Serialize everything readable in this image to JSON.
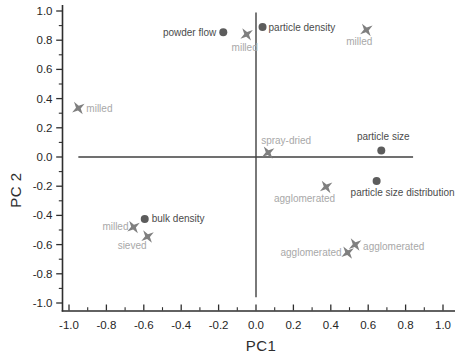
{
  "chart_data": {
    "type": "scatter",
    "title": "",
    "xlabel": "PC1",
    "ylabel": "PC 2",
    "xlim": [
      -1.1,
      1.1
    ],
    "ylim": [
      -1.1,
      1.1
    ],
    "x_ticks": [
      "-1.0",
      "-0.8",
      "-0.6",
      "-0.4",
      "-0.2",
      "0.0",
      "0.2",
      "0.4",
      "0.6",
      "0.8",
      "1.0"
    ],
    "y_ticks": [
      "-1.0",
      "-0.8",
      "-0.6",
      "-0.4",
      "-0.2",
      "0.0",
      "0.2",
      "0.4",
      "0.6",
      "0.8",
      "1.0"
    ],
    "minor_tick_step": 0.1,
    "grid": false,
    "legend": false,
    "zero_lines": {
      "horizontal_y": 0,
      "horizontal_span": [
        -0.95,
        0.84
      ],
      "vertical_x": 0,
      "vertical_span": [
        -0.96,
        0.99
      ]
    },
    "colors": {
      "axis": "#2e2e2e",
      "tick_labels": "#262626",
      "zero_line": "#404040",
      "circle_marker": "#5c5c5c",
      "circle_label": "#4b4b4b",
      "star_marker": "#7f7f7f",
      "star_label": "#a8a8a8"
    },
    "series": [
      {
        "name": "loadings",
        "marker": "circle",
        "points": [
          {
            "x": -0.175,
            "y": 0.855,
            "label": "powder flow",
            "anchor": "end",
            "dx": -7,
            "dy": 4
          },
          {
            "x": 0.035,
            "y": 0.89,
            "label": "particle density",
            "anchor": "start",
            "dx": 6,
            "dy": 4
          },
          {
            "x": 0.67,
            "y": 0.045,
            "label": "particle size",
            "anchor": "middle",
            "dx": 2,
            "dy": -10
          },
          {
            "x": 0.645,
            "y": -0.165,
            "label": "particle size distribution",
            "anchor": "start",
            "dx": -26,
            "dy": 15
          },
          {
            "x": -0.595,
            "y": -0.425,
            "label": "bulk density",
            "anchor": "start",
            "dx": 7,
            "dy": 3
          }
        ]
      },
      {
        "name": "scores",
        "marker": "star",
        "points": [
          {
            "x": -0.05,
            "y": 0.84,
            "label": "milled",
            "anchor": "middle",
            "dx": -2,
            "dy": 17
          },
          {
            "x": 0.59,
            "y": 0.87,
            "label": "milled",
            "anchor": "middle",
            "dx": -7,
            "dy": 15
          },
          {
            "x": -0.95,
            "y": 0.335,
            "label": "milled",
            "anchor": "start",
            "dx": 8,
            "dy": 4
          },
          {
            "x": 0.065,
            "y": 0.03,
            "label": "spray-dried",
            "anchor": "start",
            "dx": -7,
            "dy": -9
          },
          {
            "x": 0.375,
            "y": -0.205,
            "label": "agglomerated",
            "anchor": "end",
            "dx": 9,
            "dy": 15
          },
          {
            "x": 0.53,
            "y": -0.6,
            "label": "agglomerated",
            "anchor": "start",
            "dx": 8,
            "dy": 5
          },
          {
            "x": 0.49,
            "y": -0.655,
            "label": "agglomerated",
            "anchor": "end",
            "dx": -6,
            "dy": 3
          },
          {
            "x": -0.655,
            "y": -0.48,
            "label": "milled",
            "anchor": "end",
            "dx": -5,
            "dy": 3
          },
          {
            "x": -0.58,
            "y": -0.545,
            "label": "sieved",
            "anchor": "end",
            "dx": -1,
            "dy": 12
          }
        ]
      }
    ]
  }
}
